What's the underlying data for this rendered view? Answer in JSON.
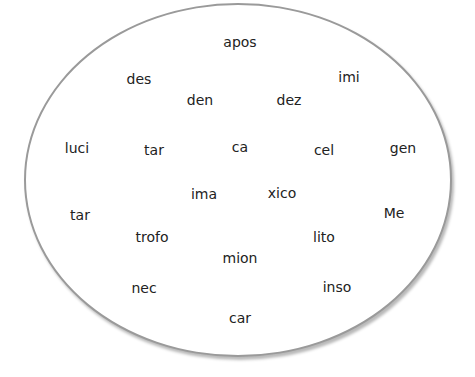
{
  "diagram": {
    "shape": "ellipse",
    "words": [
      {
        "text": "apos",
        "x": 240,
        "y": 42
      },
      {
        "text": "des",
        "x": 139,
        "y": 79
      },
      {
        "text": "imi",
        "x": 349,
        "y": 77
      },
      {
        "text": "den",
        "x": 200,
        "y": 100
      },
      {
        "text": "dez",
        "x": 289,
        "y": 100
      },
      {
        "text": "luci",
        "x": 77,
        "y": 148
      },
      {
        "text": "tar",
        "x": 154,
        "y": 150
      },
      {
        "text": "ca",
        "x": 240,
        "y": 147
      },
      {
        "text": "cel",
        "x": 324,
        "y": 150
      },
      {
        "text": "gen",
        "x": 403,
        "y": 148
      },
      {
        "text": "ima",
        "x": 204,
        "y": 194
      },
      {
        "text": "xico",
        "x": 282,
        "y": 193
      },
      {
        "text": "tar",
        "x": 80,
        "y": 215
      },
      {
        "text": "Me",
        "x": 394,
        "y": 213
      },
      {
        "text": "trofo",
        "x": 152,
        "y": 237
      },
      {
        "text": "lito",
        "x": 324,
        "y": 237
      },
      {
        "text": "mion",
        "x": 240,
        "y": 258
      },
      {
        "text": "nec",
        "x": 144,
        "y": 288
      },
      {
        "text": "inso",
        "x": 337,
        "y": 287
      },
      {
        "text": "car",
        "x": 240,
        "y": 318
      }
    ]
  }
}
